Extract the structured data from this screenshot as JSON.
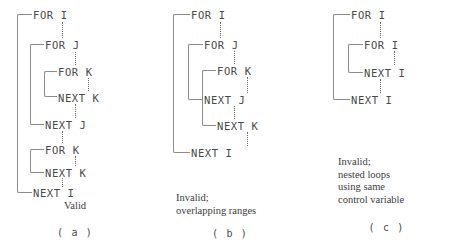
{
  "figure": {
    "panels": [
      {
        "id": "a",
        "label": "( a )",
        "caption": [
          "Valid"
        ],
        "rows": [
          {
            "text": "FOR I",
            "x": 33,
            "y": 10
          },
          {
            "text": "FOR J",
            "x": 45,
            "y": 40
          },
          {
            "text": "FOR K",
            "x": 58,
            "y": 67
          },
          {
            "text": "NEXT K",
            "x": 58,
            "y": 93
          },
          {
            "text": "NEXT J",
            "x": 45,
            "y": 120
          },
          {
            "text": "FOR K",
            "x": 45,
            "y": 145
          },
          {
            "text": "NEXT K",
            "x": 45,
            "y": 168
          },
          {
            "text": "NEXT I",
            "x": 33,
            "y": 188
          }
        ],
        "brackets": [
          {
            "x": 17,
            "y": 14,
            "w": 15,
            "h": 179
          },
          {
            "x": 30,
            "y": 44,
            "w": 14,
            "h": 81
          },
          {
            "x": 44,
            "y": 71,
            "w": 13,
            "h": 26
          },
          {
            "x": 30,
            "y": 149,
            "w": 14,
            "h": 24
          }
        ],
        "dots": [
          {
            "x": 62,
            "y": 22,
            "h": 16
          },
          {
            "x": 75,
            "y": 52,
            "h": 13
          },
          {
            "x": 88,
            "y": 78,
            "h": 13
          },
          {
            "x": 75,
            "y": 104,
            "h": 14
          },
          {
            "x": 62,
            "y": 131,
            "h": 12
          },
          {
            "x": 75,
            "y": 156,
            "h": 10
          },
          {
            "x": 62,
            "y": 178,
            "h": 9
          }
        ]
      },
      {
        "id": "b",
        "label": "( b )",
        "caption": [
          "Invalid;",
          "overlapping ranges"
        ],
        "rows": [
          {
            "text": "FOR I",
            "x": 41,
            "y": 10
          },
          {
            "text": "FOR J",
            "x": 54,
            "y": 40
          },
          {
            "text": "FOR K",
            "x": 67,
            "y": 66
          },
          {
            "text": "NEXT J",
            "x": 54,
            "y": 95
          },
          {
            "text": "NEXT K",
            "x": 67,
            "y": 121
          },
          {
            "text": "NEXT I",
            "x": 41,
            "y": 148
          }
        ],
        "brackets": [
          {
            "x": 23,
            "y": 14,
            "w": 17,
            "h": 139
          },
          {
            "x": 38,
            "y": 44,
            "w": 15,
            "h": 56
          },
          {
            "x": 52,
            "y": 70,
            "w": 14,
            "h": 56
          }
        ],
        "dots": [
          {
            "x": 70,
            "y": 22,
            "h": 16
          },
          {
            "x": 84,
            "y": 51,
            "h": 13
          },
          {
            "x": 97,
            "y": 77,
            "h": 16
          },
          {
            "x": 84,
            "y": 106,
            "h": 13
          },
          {
            "x": 97,
            "y": 132,
            "h": 14
          }
        ]
      },
      {
        "id": "c",
        "label": "( c )",
        "caption": [
          "Invalid;",
          "nested loops",
          "using same",
          "control variable"
        ],
        "rows": [
          {
            "text": "FOR I",
            "x": 41,
            "y": 10
          },
          {
            "text": "FOR I",
            "x": 54,
            "y": 40
          },
          {
            "text": "NEXT I",
            "x": 54,
            "y": 68
          },
          {
            "text": "NEXT I",
            "x": 41,
            "y": 95
          }
        ],
        "brackets": [
          {
            "x": 23,
            "y": 14,
            "w": 17,
            "h": 86
          },
          {
            "x": 38,
            "y": 44,
            "w": 15,
            "h": 29
          }
        ],
        "dots": [
          {
            "x": 70,
            "y": 22,
            "h": 16
          },
          {
            "x": 84,
            "y": 51,
            "h": 14
          },
          {
            "x": 70,
            "y": 79,
            "h": 14
          }
        ]
      }
    ]
  },
  "colors": {
    "background": "#ffffff",
    "text": "#4a4a4a",
    "bracket": "#8c8c8c",
    "dots": "#6f6f6f"
  }
}
